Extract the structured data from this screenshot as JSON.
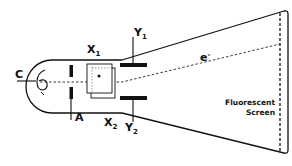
{
  "diagram": {
    "colors": {
      "stroke": "#111111",
      "background": "#ffffff"
    },
    "labels": {
      "cathode": "C",
      "anode": "A",
      "x1": {
        "main": "X",
        "sub": "1"
      },
      "x2": {
        "main": "X",
        "sub": "2"
      },
      "y1": {
        "main": "Y",
        "sub": "1"
      },
      "y2": {
        "main": "Y",
        "sub": "2"
      },
      "electron": {
        "main": "e",
        "sup": "-"
      },
      "screen_line1": "Fluorescent",
      "screen_line2": "Screen"
    },
    "components": [
      {
        "id": "cathode",
        "label": "C",
        "icon": "filament-icon"
      },
      {
        "id": "anode",
        "label": "A",
        "icon": "anode-plates"
      },
      {
        "id": "x-plates",
        "label": "X1 / X2",
        "icon": "x-deflection-plates"
      },
      {
        "id": "y-plates",
        "label": "Y1 / Y2",
        "icon": "y-deflection-plates"
      },
      {
        "id": "screen",
        "label": "Fluorescent Screen",
        "icon": "screen-dashed"
      },
      {
        "id": "beam",
        "label": "e-",
        "icon": "electron-beam-dashed"
      }
    ]
  }
}
